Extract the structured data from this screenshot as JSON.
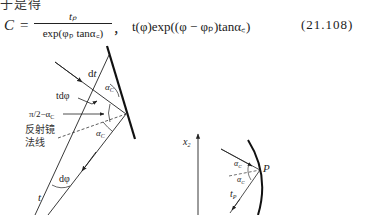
{
  "page": {
    "top_text_fragment": "于是得",
    "equation": {
      "lhs": "C",
      "equals": "=",
      "numerator": "t_P",
      "numerator_display": "tₚ",
      "denominator": "exp(φ_P tanα_C)",
      "denominator_display": "exp(φₚ tanα꜀)",
      "separator": "，",
      "rhs": "t(φ)exp((φ − φ_P)tanα_C)",
      "rhs_display": "t(φ)exp((φ − φₚ)tanα꜀)",
      "number": "(21.108)"
    }
  },
  "figure": {
    "left_diagram": {
      "labels": {
        "dt": "dt",
        "t_dphi": "tdφ",
        "angle_complement": "π/2−α",
        "angle_complement_sub": "C",
        "alpha_top": "α",
        "alpha_top_sub": "C",
        "alpha_bottom": "α",
        "alpha_bottom_sub": "C",
        "mirror_normal_line1": "反射镜",
        "mirror_normal_line2": "法线",
        "dphi": "dφ",
        "t": "t"
      }
    },
    "right_diagram": {
      "labels": {
        "axis": "x",
        "axis_sub": "2",
        "alpha_top": "α",
        "alpha_top_sub": "C",
        "alpha_bottom": "α",
        "alpha_bottom_sub": "C",
        "point": "P",
        "tp": "t",
        "tp_sub": "P"
      }
    }
  }
}
